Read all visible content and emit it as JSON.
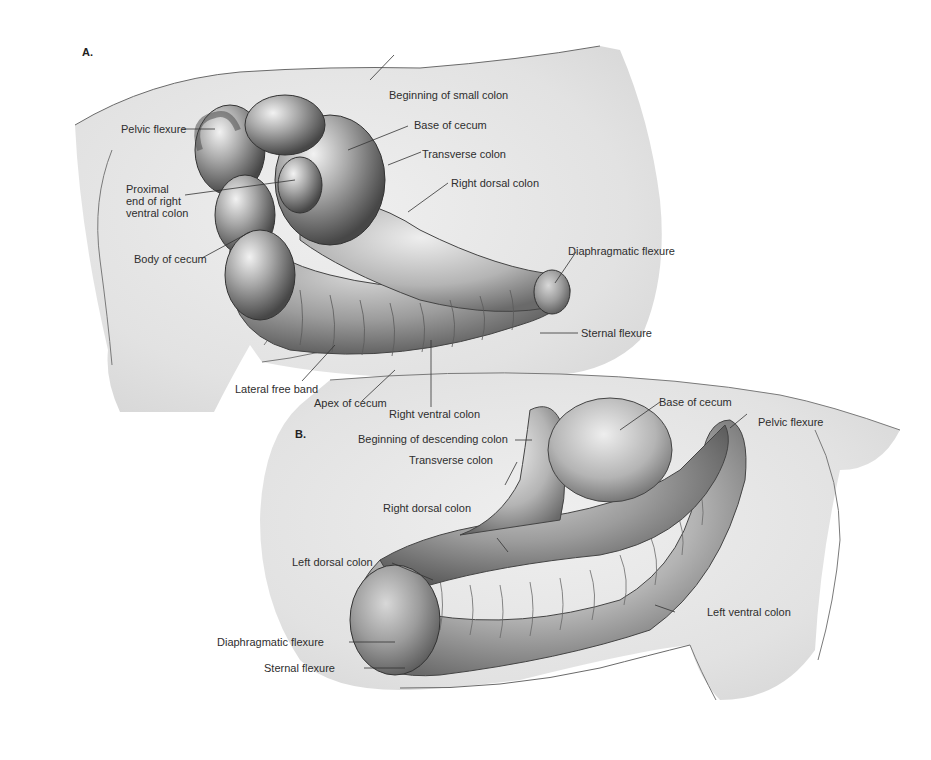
{
  "figure": {
    "panels": [
      {
        "id": "A",
        "label": "A.",
        "annotations": [
          {
            "text": "Pelvic flexure"
          },
          {
            "text": "Proximal\nend of right\nventral colon"
          },
          {
            "text": "Body of cecum"
          },
          {
            "text": "Beginning of small colon"
          },
          {
            "text": "Base of cecum"
          },
          {
            "text": "Transverse colon"
          },
          {
            "text": "Right dorsal colon"
          },
          {
            "text": "Diaphragmatic flexure"
          },
          {
            "text": "Sternal flexure"
          },
          {
            "text": "Lateral free band"
          },
          {
            "text": "Apex of cecum"
          },
          {
            "text": "Right ventral colon"
          }
        ]
      },
      {
        "id": "B",
        "label": "B.",
        "annotations": [
          {
            "text": "Base of cecum"
          },
          {
            "text": "Pelvic flexure"
          },
          {
            "text": "Beginning of descending colon"
          },
          {
            "text": "Transverse colon"
          },
          {
            "text": "Right dorsal colon"
          },
          {
            "text": "Left dorsal colon"
          },
          {
            "text": "Left ventral colon"
          },
          {
            "text": "Diaphragmatic flexure"
          },
          {
            "text": "Sternal flexure"
          }
        ]
      }
    ]
  },
  "colors": {
    "silhouette": "#e2e2e2",
    "outline": "#6a6a6a",
    "organ_dark": "#5a5a5a",
    "organ_mid": "#9a9a9a",
    "organ_light": "#d8d8d8",
    "leader": "#333333"
  }
}
